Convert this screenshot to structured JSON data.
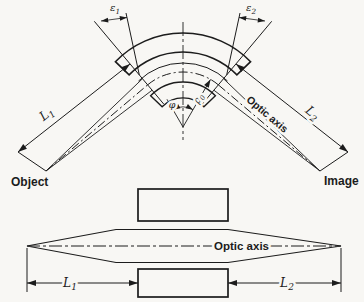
{
  "figure_type": "optics-sector-field-diagram",
  "colors": {
    "paper": "#f8f7f4",
    "ink": "#1c1c1c"
  },
  "top": {
    "object_label": "Object",
    "image_label": "Image",
    "optic_axis_label": "Optic axis",
    "epsilon1": {
      "base": "ε",
      "sub": "1"
    },
    "epsilon2": {
      "base": "ε",
      "sub": "2"
    },
    "L1": {
      "base": "L",
      "sub": "1"
    },
    "L2": {
      "base": "L",
      "sub": "2"
    },
    "phi": "φ",
    "rho0": {
      "base": "ρ",
      "sub": "0"
    }
  },
  "bottom": {
    "optic_axis_label": "Optic axis",
    "L1": {
      "base": "L",
      "sub": "1"
    },
    "L2": {
      "base": "L",
      "sub": "2"
    }
  }
}
